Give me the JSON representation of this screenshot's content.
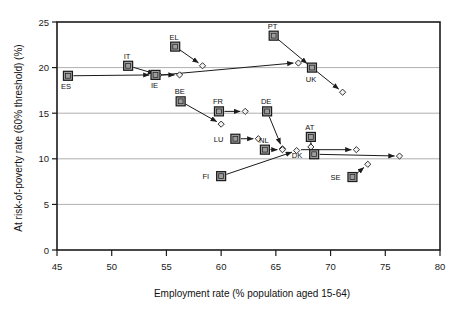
{
  "chart_data": {
    "type": "scatter",
    "title": "",
    "xlabel": "Employment rate (% population aged 15-64)",
    "ylabel": "At risk-of-poverty rate (60% threshold) (%)",
    "xlim": [
      45,
      80
    ],
    "ylim": [
      0,
      25
    ],
    "xticks": [
      "45",
      "50",
      "55",
      "60",
      "65",
      "70",
      "75",
      "80"
    ],
    "yticks": [
      "0",
      "5",
      "10",
      "15",
      "20",
      "25"
    ],
    "grid": "horizontal",
    "legend": "none",
    "marker_start": "square",
    "marker_end": "diamond",
    "connector": "arrow",
    "points": [
      {
        "code": "ES",
        "label_dx": -2,
        "label_dy": 13,
        "start": [
          46.0,
          19.1
        ],
        "end": [
          53.9,
          19.2
        ]
      },
      {
        "code": "IT",
        "label_dx": -1,
        "label_dy": -7,
        "start": [
          51.5,
          20.2
        ],
        "end": [
          54.3,
          19.2
        ]
      },
      {
        "code": "IE",
        "label_dx": -1,
        "label_dy": 13,
        "start": [
          54.0,
          19.2
        ],
        "end": [
          56.2,
          19.2
        ]
      },
      {
        "code": "EL",
        "label_dx": -1,
        "label_dy": -7,
        "start": [
          55.8,
          22.3
        ],
        "end": [
          58.3,
          20.2
        ]
      },
      {
        "code": "PT",
        "label_dx": -1,
        "label_dy": -7,
        "start": [
          64.8,
          23.5
        ],
        "end": [
          68.2,
          20.1
        ]
      },
      {
        "code": "UK",
        "label_dx": -1,
        "label_dy": 14,
        "start": [
          68.3,
          20.0
        ],
        "end": [
          71.1,
          17.3
        ]
      },
      {
        "code": "BE",
        "label_dx": -1,
        "label_dy": -7,
        "start": [
          56.3,
          16.3
        ],
        "end": [
          60.0,
          13.8
        ]
      },
      {
        "code": "FR",
        "label_dx": -1,
        "label_dy": -7,
        "start": [
          59.8,
          15.2
        ],
        "end": [
          62.2,
          15.2
        ]
      },
      {
        "code": "DE",
        "label_dx": -1,
        "label_dy": -7,
        "start": [
          64.2,
          15.2
        ],
        "end": [
          65.6,
          11.1
        ]
      },
      {
        "code": "LU",
        "label_dx": -12,
        "label_dy": 3,
        "start": [
          61.3,
          12.2
        ],
        "end": [
          63.4,
          12.2
        ]
      },
      {
        "code": "AT",
        "label_dx": -1,
        "label_dy": -7,
        "start": [
          68.2,
          12.4
        ],
        "end": [
          68.2,
          11.3
        ]
      },
      {
        "code": "NL",
        "label_dx": -1,
        "label_dy": -7,
        "start": [
          64.0,
          11.0
        ],
        "end": [
          65.6,
          11.0
        ]
      },
      {
        "code": "FI",
        "label_dx": -12,
        "label_dy": 3,
        "start": [
          60.0,
          8.1
        ],
        "end": [
          66.9,
          10.9
        ]
      },
      {
        "code": "DK",
        "label_dx": -12,
        "label_dy": 4,
        "start": [
          68.5,
          10.5
        ],
        "end": [
          76.3,
          10.3
        ]
      },
      {
        "code": "SE",
        "label_dx": -12,
        "label_dy": 3,
        "start": [
          72.0,
          8.0
        ],
        "end": [
          73.4,
          9.4
        ]
      }
    ],
    "extra_segments": [
      {
        "from": [
          54.6,
          19.2
        ],
        "to": [
          66.6,
          20.5
        ],
        "name": "ie-to-upper-right"
      },
      {
        "from": [
          67.3,
          11.0
        ],
        "to": [
          71.9,
          11.0
        ],
        "name": "nl-to-at-level"
      }
    ],
    "colors": {
      "axis": "#1b1b1b",
      "grid": "#9a9a9a",
      "marker_fill": "#9d9d9d",
      "marker_edge": "#1b1b1b",
      "diamond_fill": "#f2f2f2",
      "line": "#1b1b1b",
      "background": "#ffffff"
    }
  }
}
